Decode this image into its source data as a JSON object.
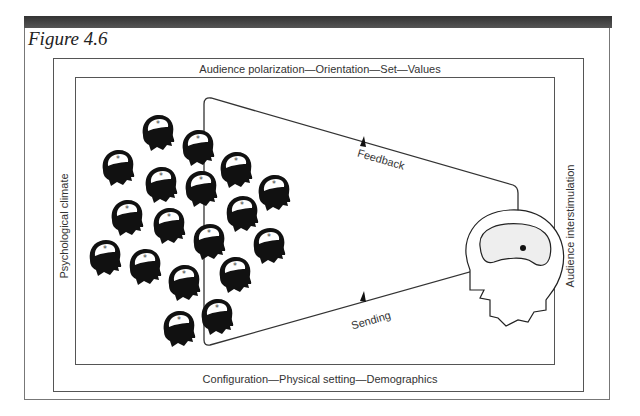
{
  "figure": {
    "title": "Figure 4.6",
    "labels": {
      "top": "Audience polarization—Orientation—Set—Values",
      "bottom": "Configuration—Physical setting—Demographics",
      "left": "Psychological climate",
      "right": "Audience interstimulation"
    },
    "flows": {
      "feedback": "Feedback",
      "sending": "Sending"
    },
    "nodes": {
      "audience": "audience-heads-cluster",
      "speaker": "speaker-head"
    },
    "colors": {
      "frame": "#555555",
      "heads": "#111111",
      "speaker_brain": "#eeeeee",
      "banner": "#3a3a3a"
    }
  }
}
